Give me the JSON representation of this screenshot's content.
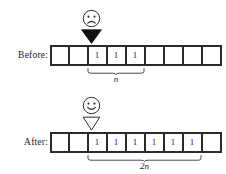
{
  "figure": {
    "ink_color": "#2b2b2b",
    "background_color": "#ffffff"
  },
  "rows": [
    {
      "id": "before",
      "label": "Before:",
      "face": "sad-face",
      "pointer": "filled-down-triangle",
      "pointer_cell_index": 2,
      "cell_count": 9,
      "cell_values": [
        "",
        "",
        "1",
        "1",
        "1",
        "",
        "",
        "",
        ""
      ],
      "brace": {
        "label": "n",
        "start_cell_index": 2,
        "end_cell_index": 4
      }
    },
    {
      "id": "after",
      "label": "After:",
      "face": "happy-face",
      "pointer": "hollow-down-triangle",
      "pointer_cell_index": 2,
      "cell_count": 9,
      "cell_values": [
        "",
        "",
        "1",
        "1",
        "1",
        "1",
        "1",
        "1",
        ""
      ],
      "brace": {
        "label": "2n",
        "start_cell_index": 2,
        "end_cell_index": 7
      }
    }
  ]
}
